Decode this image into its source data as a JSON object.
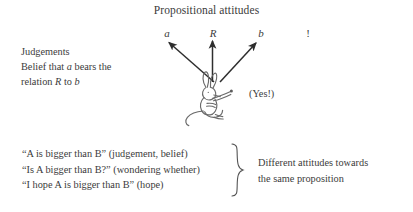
{
  "title": "Propositional attitudes",
  "variables": {
    "a": "a",
    "R": "R",
    "b": "b",
    "exclamation": "!"
  },
  "judgements": {
    "heading": "Judgements",
    "line2_prefix": "Belief that ",
    "line2_var": "a",
    "line2_suffix": " bears the",
    "line3_prefix": "relation ",
    "line3_var": "R",
    "line3_mid": " to ",
    "line3_var2": "b"
  },
  "yes_label": "(Yes!)",
  "examples": [
    "“A is bigger than B” (judgement, belief)",
    "“Is A bigger than B?” (wondering whether)",
    "“I hope A is bigger than B” (hope)"
  ],
  "summary": {
    "line1": "Different attitudes towards",
    "line2": "the same proposition"
  },
  "icons": {
    "arrows": "three-arrows-icon",
    "creature": "rabbit-sketch-icon",
    "brace": "right-curly-brace-icon"
  },
  "colors": {
    "background": "#ffffff",
    "text": "#3b3b3b",
    "ink": "#2e2e2e",
    "sketch": "#6a6a6a"
  }
}
